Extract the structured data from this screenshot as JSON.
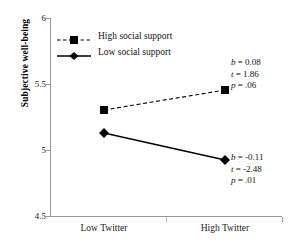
{
  "chart_data": {
    "type": "line",
    "title": "",
    "xlabel": "",
    "ylabel": "Subjective well-being",
    "categories": [
      "Low Twitter",
      "High Twitter"
    ],
    "x": [
      0,
      1
    ],
    "ylim": [
      4.5,
      6
    ],
    "yticks": [
      "4.5",
      "5",
      "5.5",
      "6"
    ],
    "ytick_values": [
      4.5,
      5,
      5.5,
      6
    ],
    "grid": false,
    "legend_position": "top-left",
    "series": [
      {
        "name": "High social support",
        "values": [
          5.3,
          5.46
        ],
        "linestyle": "dashed",
        "marker": "square",
        "color": "#000000"
      },
      {
        "name": "Low social support",
        "values": [
          5.12,
          4.92
        ],
        "linestyle": "solid",
        "marker": "diamond",
        "color": "#000000"
      }
    ],
    "annotations": [
      {
        "for_series": "High social support",
        "b_label": "b = 0.08",
        "t_label": "t = 1.86",
        "p_label": "p = .06"
      },
      {
        "for_series": "Low social support",
        "b_label": "b = -0.11",
        "t_label": "t = -2.48",
        "p_label": "p = .01"
      }
    ]
  },
  "axis": {
    "y_title": "Subjective well-being",
    "y_ticks": [
      {
        "label": "6"
      },
      {
        "label": "5.5"
      },
      {
        "label": "5"
      },
      {
        "label": "4.5"
      }
    ],
    "x_ticks": [
      {
        "label": "Low Twitter"
      },
      {
        "label": "High Twitter"
      }
    ]
  },
  "legend": {
    "entries": [
      {
        "label": "High social support",
        "marker": "square-marker-icon",
        "line": "dashed"
      },
      {
        "label": "Low social support",
        "marker": "diamond-marker-icon",
        "line": "solid"
      }
    ]
  },
  "annotations": {
    "high": {
      "b": "b = 0.08",
      "t": "t = 1.86",
      "p": "p = .06"
    },
    "low": {
      "b": "b = -0.11",
      "t": "t = -2.48",
      "p": "p = .01"
    }
  },
  "colors": {
    "line": "#000000",
    "axis": "#9a9a9a",
    "text": "#111111"
  }
}
